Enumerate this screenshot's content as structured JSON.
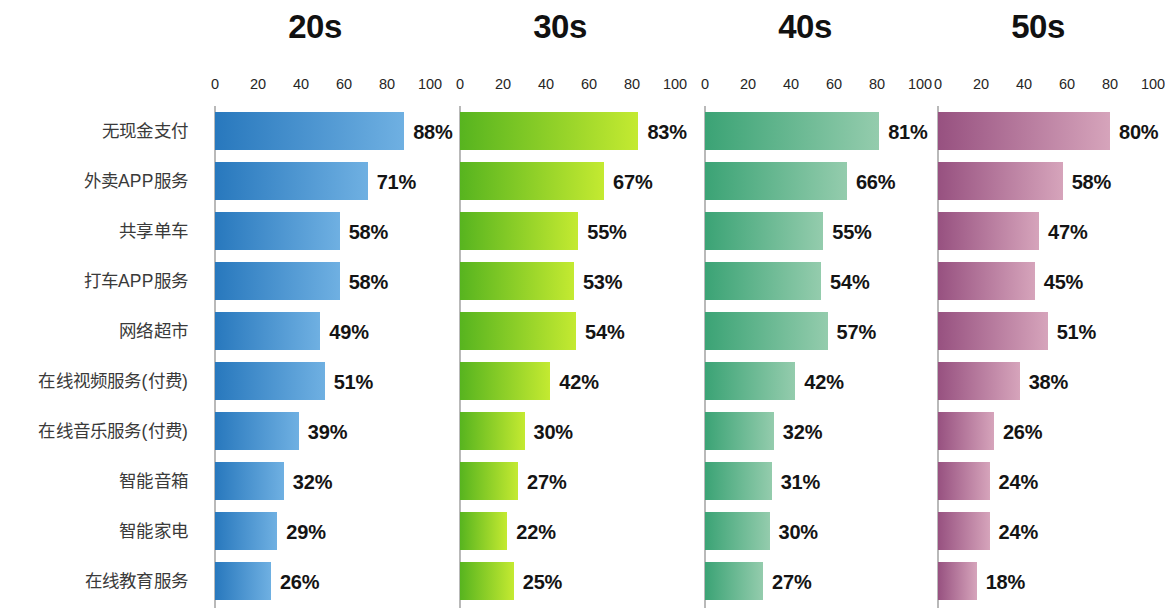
{
  "chart_data": {
    "type": "bar",
    "title": "",
    "subtitle": "",
    "xlabel": "",
    "ylabel": "",
    "xlim": [
      0,
      100
    ],
    "ticks": [
      0,
      20,
      40,
      60,
      80,
      100
    ],
    "tick_labels": [
      "0",
      "20",
      "40",
      "60",
      "80",
      "100"
    ],
    "grid": false,
    "legend_position": "none",
    "orientation": "horizontal",
    "value_suffix": "%",
    "categories": [
      "无现金支付",
      "外卖APP服务",
      "共享单车",
      "打车APP服务",
      "网络超市",
      "在线视频服务(付费)",
      "在线音乐服务(付费)",
      "智能音箱",
      "智能家电",
      "在线教育服务"
    ],
    "series": [
      {
        "name": "20s",
        "color_start": "#2878bd",
        "color_end": "#6fb0e2",
        "values": [
          88,
          71,
          58,
          58,
          49,
          51,
          39,
          32,
          29,
          26
        ],
        "labels": [
          "88%",
          "71%",
          "58%",
          "58%",
          "49%",
          "51%",
          "39%",
          "32%",
          "29%",
          "26%"
        ]
      },
      {
        "name": "30s",
        "color_start": "#57b41f",
        "color_end": "#c4ea31",
        "values": [
          83,
          67,
          55,
          53,
          54,
          42,
          30,
          27,
          22,
          25
        ],
        "labels": [
          "83%",
          "67%",
          "55%",
          "53%",
          "54%",
          "42%",
          "30%",
          "27%",
          "22%",
          "25%"
        ]
      },
      {
        "name": "40s",
        "color_start": "#3ba375",
        "color_end": "#94ccad",
        "values": [
          81,
          66,
          55,
          54,
          57,
          42,
          32,
          31,
          30,
          27
        ],
        "labels": [
          "81%",
          "66%",
          "55%",
          "54%",
          "57%",
          "42%",
          "32%",
          "31%",
          "30%",
          "27%"
        ]
      },
      {
        "name": "50s",
        "color_start": "#975180",
        "color_end": "#d6a4bb",
        "values": [
          80,
          58,
          47,
          45,
          51,
          38,
          26,
          24,
          24,
          18
        ],
        "labels": [
          "80%",
          "58%",
          "47%",
          "45%",
          "51%",
          "38%",
          "26%",
          "24%",
          "24%",
          "18%"
        ]
      }
    ]
  },
  "layout": {
    "label_column_width": 200,
    "panel_lefts": [
      200,
      445,
      690,
      923
    ],
    "panel_widths": [
      245,
      245,
      233,
      235
    ],
    "axis_origin_offset": 15,
    "axis_scale_px": 2.15,
    "first_bar_top": 112,
    "row_pitch": 50,
    "bar_height": 38
  }
}
